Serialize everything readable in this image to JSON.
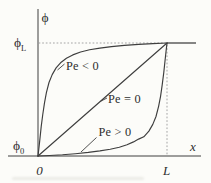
{
  "figure": {
    "background_color": "#fcfcf9",
    "ink_color": "#3e3e3e",
    "guide_color": "#9b9b9b",
    "y_axis_symbol": "ϕ",
    "x_axis_symbol": "x",
    "origin_tick_label": "0",
    "x_tick_label": "L",
    "y_upper_tick": {
      "base": "ϕ",
      "sub": "L"
    },
    "y_lower_tick": {
      "base": "ϕ",
      "sub": "0"
    }
  },
  "chart_data": {
    "type": "line",
    "title": "",
    "xlabel": "x",
    "ylabel": "ϕ",
    "x_tick_labels": [
      "0",
      "L"
    ],
    "y_tick_labels": [
      "ϕ0",
      "ϕL"
    ],
    "x_range_normalized": [
      0,
      1
    ],
    "y_range_normalized": [
      0,
      1
    ],
    "grid": "off",
    "guides": [
      "dotted horizontal line at ϕ = ϕL from y-axis to x = L",
      "dotted vertical line at x = L from x-axis to ϕ = ϕL",
      "solid horizontal segment at ϕ = ϕL extending right of x = L"
    ],
    "legend_position": "inline labels with leader lines",
    "series": [
      {
        "name": "Pe < 0",
        "shape": "steep rise from (0, ϕ0) then asymptotic approach to ϕL at x = L",
        "points": [
          [
            0,
            0
          ],
          [
            0.007,
            0.07
          ],
          [
            0.015,
            0.15
          ],
          [
            0.025,
            0.26
          ],
          [
            0.037,
            0.37
          ],
          [
            0.05,
            0.47
          ],
          [
            0.065,
            0.56
          ],
          [
            0.085,
            0.65
          ],
          [
            0.11,
            0.72
          ],
          [
            0.14,
            0.78
          ],
          [
            0.18,
            0.83
          ],
          [
            0.22,
            0.865
          ],
          [
            0.27,
            0.895
          ],
          [
            0.33,
            0.92
          ],
          [
            0.4,
            0.94
          ],
          [
            0.48,
            0.955
          ],
          [
            0.57,
            0.968
          ],
          [
            0.67,
            0.979
          ],
          [
            0.78,
            0.988
          ],
          [
            0.89,
            0.995
          ],
          [
            1,
            1
          ]
        ]
      },
      {
        "name": "Pe = 0",
        "shape": "straight line from (0, ϕ0) to (L, ϕL)",
        "points": [
          [
            0,
            0
          ],
          [
            1,
            1
          ]
        ]
      },
      {
        "name": "Pe > 0",
        "shape": "stays near ϕ0 then rises steeply to ϕL at x = L",
        "points": [
          [
            0,
            0
          ],
          [
            0.09,
            0.004
          ],
          [
            0.19,
            0.011
          ],
          [
            0.29,
            0.02
          ],
          [
            0.39,
            0.032
          ],
          [
            0.48,
            0.045
          ],
          [
            0.56,
            0.06
          ],
          [
            0.63,
            0.078
          ],
          [
            0.69,
            0.1
          ],
          [
            0.74,
            0.125
          ],
          [
            0.78,
            0.15
          ],
          [
            0.82,
            0.17
          ],
          [
            0.86,
            0.22
          ],
          [
            0.89,
            0.28
          ],
          [
            0.915,
            0.35
          ],
          [
            0.935,
            0.44
          ],
          [
            0.95,
            0.53
          ],
          [
            0.963,
            0.63
          ],
          [
            0.975,
            0.74
          ],
          [
            0.985,
            0.85
          ],
          [
            0.993,
            0.93
          ],
          [
            1,
            1
          ]
        ]
      }
    ]
  }
}
